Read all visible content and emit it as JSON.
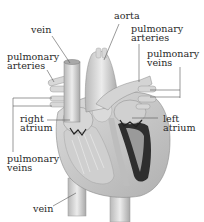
{
  "diagram": {
    "labels": {
      "vein_top": "vein",
      "aorta": "aorta",
      "pulmonary_arteries_right_line1": "pulmonary",
      "pulmonary_arteries_right_line2": "arteries",
      "pulmonary_arteries_left_line1": "pulmonary",
      "pulmonary_arteries_left_line2": "arteries",
      "pulmonary_veins_right_line1": "pulmonary",
      "pulmonary_veins_right_line2": "veins",
      "right_atrium_line1": "right",
      "right_atrium_line2": "atrium",
      "left_atrium_line1": "left",
      "left_atrium_line2": "atrium",
      "pulmonary_veins_left_line1": "pulmonary",
      "pulmonary_veins_left_line2": "veins",
      "vein_bottom": "vein"
    },
    "colors": {
      "tissue_light": "#e4e4e4",
      "tissue_mid": "#c4c4c4",
      "tissue_dark": "#8a8a8a",
      "chamber_dark": "#2a2a2a",
      "leader_line": "#555555",
      "text": "#2a2a2a"
    }
  }
}
